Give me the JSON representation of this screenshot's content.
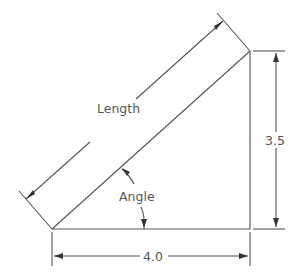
{
  "diagram": {
    "type": "right-triangle-dimension-drawing",
    "labels": {
      "length": "Length",
      "angle": "Angle",
      "height": "3.5",
      "base": "4.0"
    },
    "colors": {
      "line": "#555555",
      "background": "#ffffff"
    }
  }
}
